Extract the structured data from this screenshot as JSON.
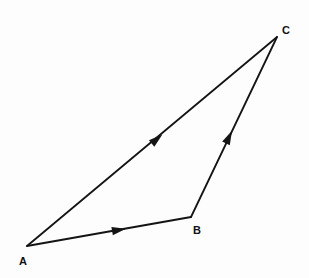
{
  "diagram": {
    "type": "vector-triangle",
    "background_color": "#fdfdfd",
    "line_color": "#141414",
    "label_color": "#111111",
    "line_width": 1.8,
    "canvas": {
      "width": 309,
      "height": 278
    },
    "points": [
      {
        "id": "A",
        "label": "A",
        "x": 27,
        "y": 246,
        "label_x": 23,
        "label_y": 262
      },
      {
        "id": "B",
        "label": "B",
        "x": 191,
        "y": 217,
        "label_x": 197,
        "label_y": 231
      },
      {
        "id": "C",
        "label": "C",
        "x": 277,
        "y": 37,
        "label_x": 286,
        "label_y": 31
      }
    ],
    "vectors": [
      {
        "id": "AC",
        "name": "vector-a-to-c",
        "from": "A",
        "to": "C",
        "path": "M 27 246 L 277 37",
        "arrow_x": 157,
        "arrow_y": 139,
        "arrow_angle": -39.9
      },
      {
        "id": "AB",
        "name": "vector-a-to-b",
        "from": "A",
        "to": "B",
        "path": "M 27 246 L 191 217",
        "arrow_x": 119,
        "arrow_y": 230,
        "arrow_angle": -10.0
      },
      {
        "id": "BC",
        "name": "vector-b-to-c",
        "from": "B",
        "to": "C",
        "path": "M 191 217 L 277 37",
        "arrow_x": 229,
        "arrow_y": 137,
        "arrow_angle": -64.5
      }
    ],
    "arrow_shape": {
      "length": 14,
      "half_width": 4.2
    }
  }
}
